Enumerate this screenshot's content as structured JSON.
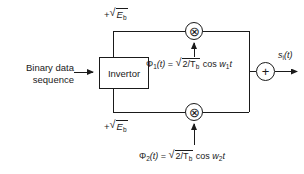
{
  "diagram": {
    "stroke_color": "#1a1a1a",
    "background_color": "#ffffff",
    "input": {
      "caption_line1": "Binary data",
      "caption_line2": "sequence",
      "arrow_icon": "arrow-right-icon"
    },
    "invertor": {
      "label": "Invertor"
    },
    "gain_top": {
      "sign": "+",
      "radical": "√",
      "radicand": "E",
      "radicand_sub": "b"
    },
    "gain_bottom": {
      "sign": "+",
      "radical": "√",
      "radicand": "E",
      "radicand_sub": "b"
    },
    "multiplier_top": {
      "glyph": "⊗",
      "name": "multiplier"
    },
    "multiplier_bottom": {
      "glyph": "⊗",
      "name": "multiplier"
    },
    "summer": {
      "glyph": "+",
      "name": "summer"
    },
    "carrier1": {
      "symbol": "Φ",
      "symbol_sub": "1",
      "arg": "(t)",
      "equals": "=",
      "radical": "√",
      "radicand_numer": "2/T",
      "radicand_sub": "b",
      "trig": "cos",
      "freq": "w",
      "freq_sub": "1",
      "time": "t"
    },
    "carrier2": {
      "symbol": "Φ",
      "symbol_sub": "2",
      "arg": "(t)",
      "equals": "=",
      "radical": "√",
      "radicand_numer": "2/T",
      "radicand_sub": "b",
      "trig": "cos",
      "freq": "w",
      "freq_sub": "2",
      "time": "t"
    },
    "output": {
      "symbol": "s",
      "symbol_sub": "i",
      "arg": "(t)",
      "arrow_icon": "arrow-right-icon"
    }
  }
}
